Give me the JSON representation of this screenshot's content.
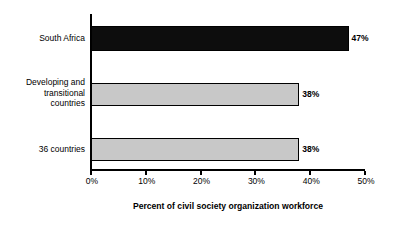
{
  "chart_data": {
    "type": "bar",
    "orientation": "horizontal",
    "title": "",
    "xlabel": "Percent of civil society organization workforce",
    "ylabel": "",
    "categories": [
      "South Africa",
      "Developing and\ntransitional\ncountries",
      "36 countries"
    ],
    "values": [
      47,
      38,
      38
    ],
    "value_labels": [
      "47%",
      "38%",
      "38%"
    ],
    "xlim": [
      0,
      50
    ],
    "xticks": [
      0,
      10,
      20,
      30,
      40,
      50
    ],
    "xtick_labels": [
      "0%",
      "10%",
      "20%",
      "30%",
      "40%",
      "50%"
    ],
    "grid": false,
    "legend": false,
    "bar_colors": [
      "#0d0d0d",
      "#c8c8c8",
      "#c8c8c8"
    ],
    "bar_edge_color": "#000000",
    "background_color": "#ffffff",
    "axis_color": "#000000"
  }
}
